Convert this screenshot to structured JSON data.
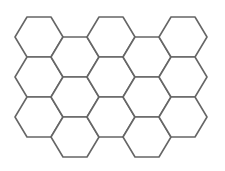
{
  "diagram": {
    "type": "hexagon-grid",
    "orientation": "flat-top",
    "stroke_color": "#666666",
    "fill_color": "#ffffff",
    "background": "#ffffff",
    "hex_radius": 24,
    "hex_half_height": 20,
    "column_x": [
      39,
      75,
      111,
      147,
      183
    ],
    "even_column_y": [
      37,
      77,
      117
    ],
    "odd_column_y": [
      57,
      97,
      137
    ],
    "columns": 5,
    "rows_per_column": 3,
    "hexagon_count": 15
  }
}
